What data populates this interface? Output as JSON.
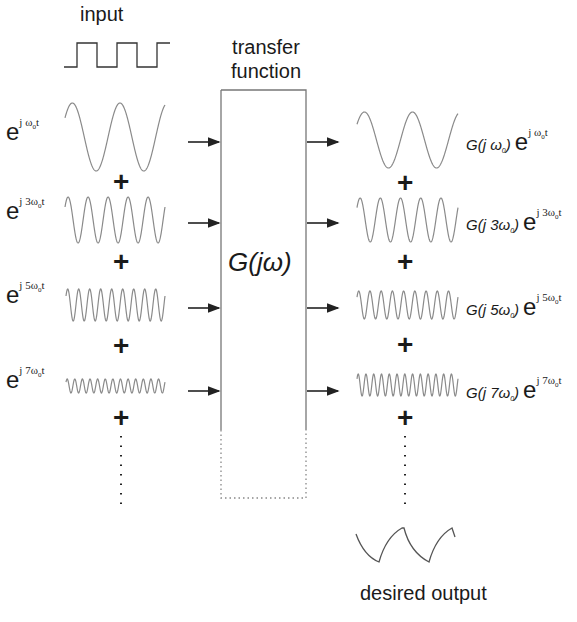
{
  "title_input": "input",
  "title_transfer": [
    "transfer",
    "function"
  ],
  "block_label": "G(jω)",
  "output_label": "desired output",
  "plus": "+",
  "inputs": [
    {
      "e": "e",
      "sup_prefix": "j ",
      "omega": "ω",
      "sub": "0",
      "t": "t",
      "mult": ""
    },
    {
      "e": "e",
      "sup_prefix": "j ",
      "omega": "ω",
      "sub": "0",
      "t": "t",
      "mult": "3"
    },
    {
      "e": "e",
      "sup_prefix": "j ",
      "omega": "ω",
      "sub": "0",
      "t": "t",
      "mult": "5"
    },
    {
      "e": "e",
      "sup_prefix": "j ",
      "omega": "ω",
      "sub": "0",
      "t": "t",
      "mult": "7"
    }
  ],
  "outputs": [
    {
      "g": "G(j ",
      "mult": "",
      "omega": "ω",
      "sub": "0",
      "close": ")"
    },
    {
      "g": "G(j ",
      "mult": "3",
      "omega": "ω",
      "sub": "0",
      "close": ")"
    },
    {
      "g": "G(j ",
      "mult": "5",
      "omega": "ω",
      "sub": "0",
      "close": ")"
    },
    {
      "g": "G(j ",
      "mult": "7",
      "omega": "ω",
      "sub": "0",
      "close": ")"
    }
  ],
  "colors": {
    "wave": "#8a8a8a",
    "line": "#222222",
    "box": "#777777"
  }
}
